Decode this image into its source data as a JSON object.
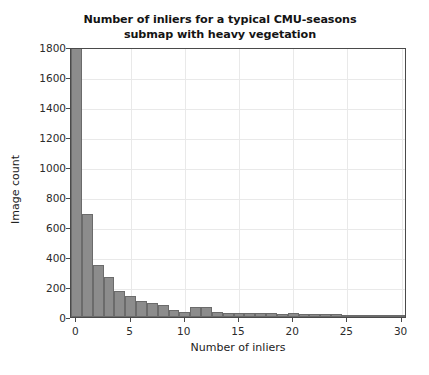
{
  "chart_data": {
    "type": "bar",
    "title": "Number of inliers for a typical CMU-seasons submap with heavy vegetation",
    "title_line1": "Number of inliers for a typical CMU-seasons",
    "title_line2": "submap with heavy vegetation",
    "xlabel": "Number of inliers",
    "ylabel": "Image count",
    "xlim": [
      -0.5,
      30.5
    ],
    "ylim": [
      0,
      1800
    ],
    "xticks": [
      0,
      5,
      10,
      15,
      20,
      25,
      30
    ],
    "xtick_labels": [
      "0",
      "5",
      "10",
      "15",
      "20",
      "25",
      "30"
    ],
    "yticks": [
      0,
      200,
      400,
      600,
      800,
      1000,
      1200,
      1400,
      1600,
      1800
    ],
    "ytick_labels": [
      "0",
      "200",
      "400",
      "600",
      "800",
      "1000",
      "1200",
      "1400",
      "1600",
      "1800"
    ],
    "grid": true,
    "legend": false,
    "bar_color": "#8c8c8c",
    "bar_edge_color": "#6b6b6b",
    "note": "first bar is clipped by the y-axis limit of 1800",
    "categories": [
      0,
      1,
      2,
      3,
      4,
      5,
      6,
      7,
      8,
      9,
      10,
      11,
      12,
      13,
      14,
      15,
      16,
      17,
      18,
      19,
      20,
      21,
      22,
      23,
      24,
      25,
      26,
      27,
      28,
      29,
      30
    ],
    "values": [
      1860,
      690,
      345,
      265,
      175,
      140,
      105,
      95,
      80,
      45,
      35,
      70,
      70,
      35,
      30,
      25,
      25,
      30,
      25,
      20,
      25,
      20,
      20,
      18,
      18,
      15,
      15,
      12,
      12,
      10,
      10
    ]
  },
  "colors": {
    "background": "#ffffff",
    "axis": "#4a4a4a",
    "grid": "#e9e9e9",
    "text": "#1c1c1c"
  }
}
